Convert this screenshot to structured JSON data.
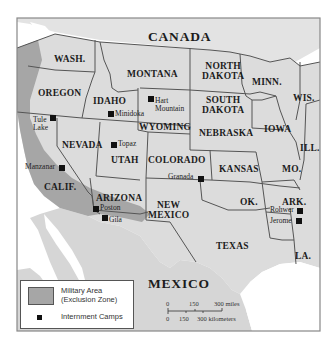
{
  "map": {
    "countries": [
      {
        "id": "canada",
        "label": "CANADA"
      },
      {
        "id": "mexico",
        "label": "MEXICO"
      }
    ],
    "states": [
      {
        "id": "wash",
        "label": "WASH."
      },
      {
        "id": "oregon",
        "label": "OREGON"
      },
      {
        "id": "idaho",
        "label": "IDAHO"
      },
      {
        "id": "montana",
        "label": "MONTANA"
      },
      {
        "id": "north-dakota",
        "label": "NORTH DAKOTA",
        "line1": "NORTH",
        "line2": "DAKOTA"
      },
      {
        "id": "south-dakota",
        "label": "SOUTH DAKOTA",
        "line1": "SOUTH",
        "line2": "DAKOTA"
      },
      {
        "id": "minn",
        "label": "MINN."
      },
      {
        "id": "wis",
        "label": "WIS."
      },
      {
        "id": "wyoming",
        "label": "WYOMING"
      },
      {
        "id": "nebraska",
        "label": "NEBRASKA"
      },
      {
        "id": "iowa",
        "label": "IOWA"
      },
      {
        "id": "ill",
        "label": "ILL."
      },
      {
        "id": "nevada",
        "label": "NEVADA"
      },
      {
        "id": "utah",
        "label": "UTAH"
      },
      {
        "id": "colorado",
        "label": "COLORADO"
      },
      {
        "id": "kansas",
        "label": "KANSAS"
      },
      {
        "id": "mo",
        "label": "MO."
      },
      {
        "id": "calif",
        "label": "CALIF."
      },
      {
        "id": "arizona",
        "label": "ARIZONA"
      },
      {
        "id": "new-mexico",
        "label": "NEW MEXICO",
        "line1": "NEW",
        "line2": "MEXICO"
      },
      {
        "id": "ok",
        "label": "OK."
      },
      {
        "id": "ark",
        "label": "ARK."
      },
      {
        "id": "texas",
        "label": "TEXAS"
      },
      {
        "id": "la",
        "label": "LA."
      }
    ],
    "camps": [
      {
        "id": "tule-lake",
        "label": "Tule Lake",
        "line1": "Tule",
        "line2": "Lake"
      },
      {
        "id": "minidoka",
        "label": "Minidoka"
      },
      {
        "id": "hart-mountain",
        "label": "Hart Mountain",
        "line1": "Hart",
        "line2": "Mountain"
      },
      {
        "id": "topaz",
        "label": "Topaz"
      },
      {
        "id": "manzanar",
        "label": "Manzanar"
      },
      {
        "id": "granada",
        "label": "Granada"
      },
      {
        "id": "poston",
        "label": "Poston"
      },
      {
        "id": "gila",
        "label": "Gila"
      },
      {
        "id": "rohwer",
        "label": "Rohwer"
      },
      {
        "id": "jerome",
        "label": "Jerome"
      }
    ]
  },
  "legend": {
    "military_area_line1": "Military Area",
    "military_area_line2": "(Exclusion Zone)",
    "camps_label": "Internment Camps"
  },
  "scale": {
    "miles": {
      "ticks": [
        "0",
        "150",
        "300 miles"
      ]
    },
    "kilometers": {
      "ticks": [
        "0",
        "150",
        "300 kilometers"
      ]
    }
  },
  "colors": {
    "land": "#dcdcdc",
    "canada": "#e3e3e3",
    "mexico": "#d6d6d6",
    "water": "#ffffff",
    "exclusion_zone": "#a6a6a6",
    "border": "#555555"
  }
}
